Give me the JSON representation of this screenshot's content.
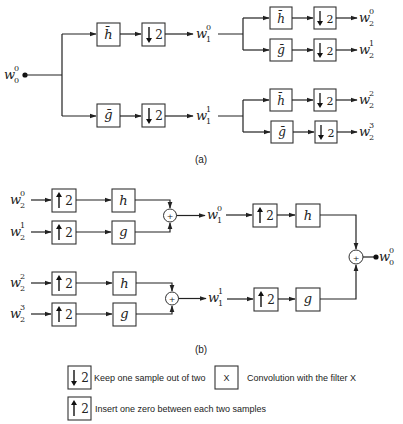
{
  "figure": {
    "panel_a_caption": "(a)",
    "panel_b_caption": "(b)"
  },
  "analysis": {
    "input": {
      "base": "w",
      "sup": "0",
      "sub": "0"
    },
    "level1": [
      {
        "base": "w",
        "sup": "0",
        "sub": "1"
      },
      {
        "base": "w",
        "sup": "1",
        "sub": "1"
      }
    ],
    "level2": [
      {
        "base": "w",
        "sup": "0",
        "sub": "2"
      },
      {
        "base": "w",
        "sup": "1",
        "sub": "2"
      },
      {
        "base": "w",
        "sup": "2",
        "sub": "2"
      },
      {
        "base": "w",
        "sup": "3",
        "sub": "2"
      }
    ],
    "filter_h": "h̄",
    "filter_g": "ḡ",
    "down_factor": "2"
  },
  "synthesis": {
    "inputs": [
      {
        "base": "w",
        "sup": "0",
        "sub": "2"
      },
      {
        "base": "w",
        "sup": "1",
        "sub": "2"
      },
      {
        "base": "w",
        "sup": "2",
        "sub": "2"
      },
      {
        "base": "w",
        "sup": "3",
        "sub": "2"
      }
    ],
    "level1": [
      {
        "base": "w",
        "sup": "0",
        "sub": "1"
      },
      {
        "base": "w",
        "sup": "1",
        "sub": "1"
      }
    ],
    "output": {
      "base": "w",
      "sup": "0",
      "sub": "0"
    },
    "filter_h": "h",
    "filter_g": "g",
    "up_factor": "2",
    "adder": "+"
  },
  "legend": {
    "down_factor": "2",
    "down_text": "Keep one sample out of two",
    "up_factor": "2",
    "up_text": "Insert one zero between each two samples",
    "filter_symbol": "X",
    "filter_text": "Convolution with the filter X"
  }
}
